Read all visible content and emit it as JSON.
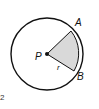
{
  "diagram": {
    "type": "circle-sector",
    "center_label": "P",
    "point_a_label": "A",
    "point_b_label": "B",
    "radius_label": "r",
    "problem_number": "2",
    "colors": {
      "stroke": "#111111",
      "sector_fill": "#d9d9d9",
      "background": "#ffffff"
    }
  }
}
